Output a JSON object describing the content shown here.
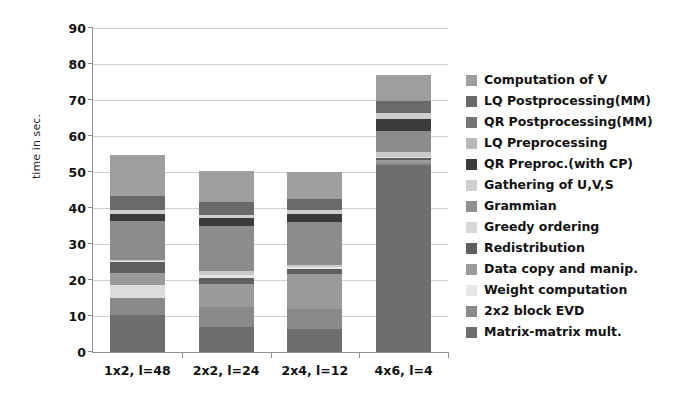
{
  "chart_data": {
    "type": "bar",
    "subtype": "stacked-bar",
    "title": "",
    "xlabel": "",
    "ylabel": "time in sec.",
    "ylim": [
      0,
      90
    ],
    "ytick_step": 10,
    "yticks": [
      0,
      10,
      20,
      30,
      40,
      50,
      60,
      70,
      80,
      90
    ],
    "grid": true,
    "legend_position": "right",
    "categories": [
      "1x2, l=48",
      "2x2, l=24",
      "2x4, l=12",
      "4x6, l=4"
    ],
    "totals": [
      54.8,
      50.4,
      50.0,
      77.0
    ],
    "stack_order_bottom_to_top": [
      "Matrix-matrix mult.",
      "2x2 block EVD",
      "Weight computation",
      "Data copy and manip.",
      "Redistribution",
      "Greedy ordering",
      "Grammian",
      "Gathering of U,V,S",
      "QR Preproc.(with CP)",
      "LQ Preprocessing",
      "QR Postprocessing(MM)",
      "LQ Postprocessing(MM)",
      "Computation of V"
    ],
    "series": [
      {
        "name": "Matrix-matrix mult.",
        "color": "#6e6e6e",
        "values": [
          10.2,
          7.0,
          6.3,
          52.0
        ]
      },
      {
        "name": "2x2 block EVD",
        "color": "#8a8a8a",
        "values": [
          4.8,
          5.4,
          5.6,
          0.5
        ]
      },
      {
        "name": "Weight computation",
        "color": "#dcdcdc",
        "values": [
          3.6,
          0.0,
          0.0,
          0.0
        ]
      },
      {
        "name": "Data copy and manip.",
        "color": "#9a9a9a",
        "values": [
          3.4,
          6.6,
          9.7,
          0.8
        ]
      },
      {
        "name": "Redistribution",
        "color": "#5f5f5f",
        "values": [
          2.9,
          1.7,
          1.4,
          0.6
        ]
      },
      {
        "name": "Greedy ordering",
        "color": "#e6e6e6",
        "values": [
          0.3,
          0.8,
          0.5,
          0.4
        ]
      },
      {
        "name": "Grammian",
        "color": "#8f8f8f",
        "values": [
          0.0,
          0.0,
          0.0,
          0.0
        ]
      },
      {
        "name": "Gathering of U,V,S",
        "color": "#c9c9c9",
        "values": [
          0.5,
          1.1,
          0.8,
          1.4
        ]
      },
      {
        "name": "QR Preproc.(with CP)",
        "color": "#8c8c8c",
        "values": [
          10.6,
          12.4,
          11.9,
          5.8
        ]
      },
      {
        "name": "LQ Preprocessing",
        "color": "#3b3b3b",
        "values": [
          2.0,
          2.2,
          2.2,
          3.2
        ]
      },
      {
        "name": "QR Postprocessing(MM)",
        "color": "#cfcfcf",
        "values": [
          1.1,
          1.0,
          1.1,
          1.6
        ]
      },
      {
        "name": "LQ Postprocessing(MM)",
        "color": "#6a6a6a",
        "values": [
          4.0,
          3.4,
          2.9,
          3.4
        ]
      },
      {
        "name": "Computation of V",
        "color": "#9e9e9e",
        "values": [
          11.4,
          8.8,
          7.6,
          7.3
        ]
      }
    ]
  },
  "legend": {
    "items": [
      {
        "label": "Computation of V",
        "color": "#9e9e9e"
      },
      {
        "label": "LQ Postprocessing(MM)",
        "color": "#6a6a6a"
      },
      {
        "label": "QR Postprocessing(MM)",
        "color": "#747474"
      },
      {
        "label": "LQ Preprocessing",
        "color": "#b8b8b8"
      },
      {
        "label": "QR Preproc.(with CP)",
        "color": "#3b3b3b"
      },
      {
        "label": "Gathering of U,V,S",
        "color": "#cfcfcf"
      },
      {
        "label": "Grammian",
        "color": "#8f8f8f"
      },
      {
        "label": "Greedy ordering",
        "color": "#d8d8d8"
      },
      {
        "label": "Redistribution",
        "color": "#5f5f5f"
      },
      {
        "label": "Data copy and manip.",
        "color": "#9a9a9a"
      },
      {
        "label": "Weight computation",
        "color": "#e6e6e6"
      },
      {
        "label": "2x2 block EVD",
        "color": "#8a8a8a"
      },
      {
        "label": "Matrix-matrix mult.",
        "color": "#6e6e6e"
      }
    ]
  },
  "colors": {
    "background": "#ffffff",
    "axis": "#8f8f8f",
    "grid": "#cfcfcf",
    "text": "#111111"
  }
}
